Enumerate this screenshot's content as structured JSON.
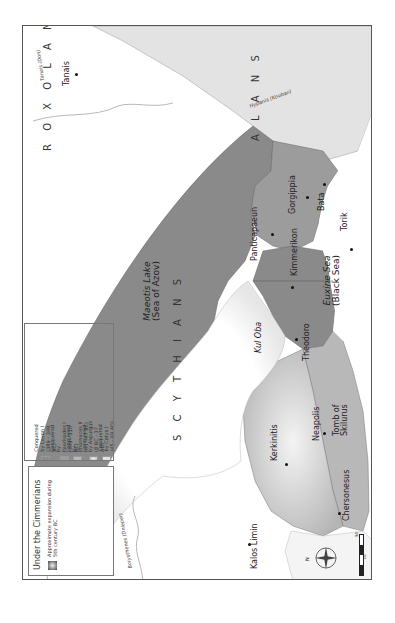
{
  "legend": {
    "title": "Under the Cimmerians",
    "note": "Approximate expansion during 5th century BC",
    "items": [
      {
        "label": "Conquered by Levon I (389 - 349 BC)",
        "color": "#8a8a8a"
      },
      {
        "label": "Conquered by Paerisades I (349 - 310 BC)",
        "color": "#9c9c9c"
      },
      {
        "label": "Conquered by Pharnaces II (63 - 47 BC)",
        "color": "#b8b8b8"
      },
      {
        "label": "Conquered by Aspurgus (8 BC - 37 AD)",
        "color": "#cfcfcf"
      },
      {
        "label": "Conquered by Cotys I (45 - 69 AD)",
        "color": "#e3e3e3"
      }
    ]
  },
  "peoples": {
    "roxolani": "R O X O L A N I",
    "alans": "A L A N S",
    "scythians": "S C Y T H I A N S"
  },
  "seas": {
    "azov_name": "Maeotis Lake",
    "azov_alt": "(Sea of Azov)",
    "black_name": "Euxine Sea",
    "black_alt": "(Black Sea)"
  },
  "rivers": {
    "don": "Tanais (Don)",
    "kouban": "Hypanis (Kouban)",
    "dnieper": "Borysthenes (Dnieper)"
  },
  "cities": {
    "tanais": "Tanais",
    "torik": "Torik",
    "bata": "Bata",
    "gorgippia": "Gorgippia",
    "panticapaeum": "Panticapaeun",
    "kimmerikon": "Kimmerikon",
    "kul_oba": "Kul Oba",
    "theodoro": "Theodoro",
    "neapolis": "Neapolis",
    "tomb_skilurus": "Tomb of Skilurus",
    "kerkinitis": "Kerkinitis",
    "chersonesus": "Chersonesus",
    "kalos_limin": "Kalos Limin"
  },
  "compass": {
    "north": "N"
  },
  "scale": {
    "max": "50",
    "unit": "km"
  },
  "colors": {
    "levon": "#8a8a8a",
    "paerisades": "#9c9c9c",
    "pharnaces": "#b8b8b8",
    "aspurgus": "#cfcfcf",
    "cotys": "#e3e3e3",
    "water": "#ffffff",
    "frame": "#555555"
  }
}
